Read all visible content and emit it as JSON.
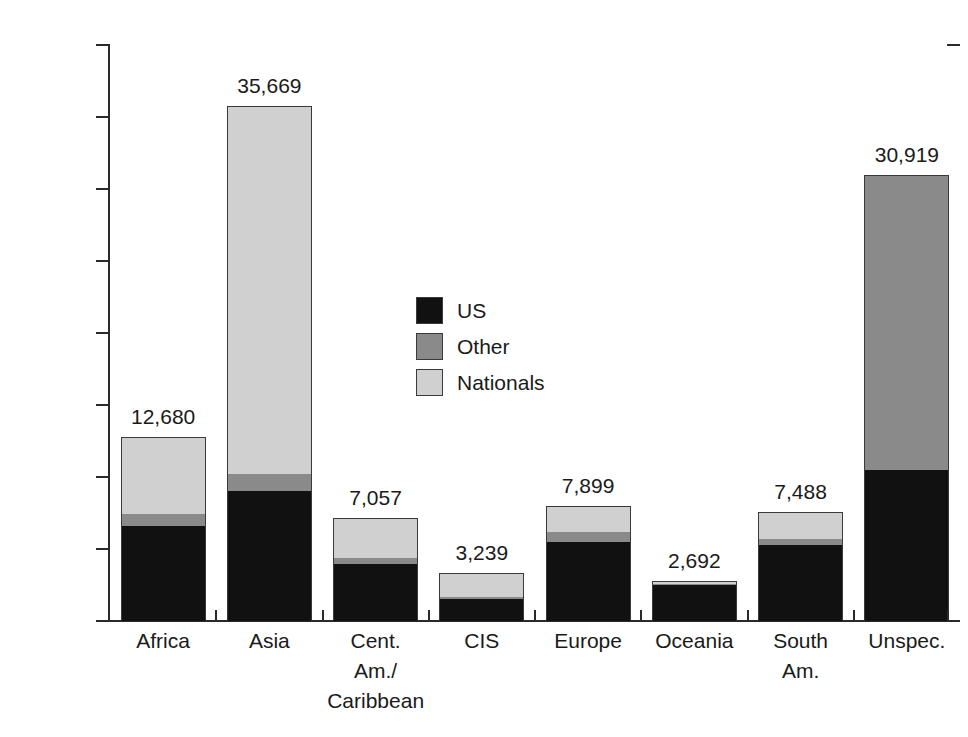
{
  "chart_data": {
    "type": "bar",
    "subtype": "stacked-bar",
    "title": "",
    "xlabel": "",
    "ylabel": "",
    "ylim": [
      0,
      40000
    ],
    "ytick_values": [
      0,
      5000,
      10000,
      15000,
      20000,
      25000,
      30000,
      35000,
      40000
    ],
    "ytick_labels": [
      "0",
      "5000",
      "10000",
      "15000",
      "20000",
      "25000",
      "30000",
      "35000",
      "40000"
    ],
    "grid": false,
    "legend_position": "center-inside",
    "categories": [
      "Africa",
      "Asia",
      "Cent. Am./Caribbean",
      "CIS",
      "Europe",
      "Oceania",
      "South Am.",
      "Unspec."
    ],
    "category_label_lines": [
      [
        "Africa"
      ],
      [
        "Asia"
      ],
      [
        "Cent.",
        "Am./",
        "Caribbean"
      ],
      [
        "CIS"
      ],
      [
        "Europe"
      ],
      [
        "Oceania"
      ],
      [
        "South",
        "Am."
      ],
      [
        "Unspec."
      ]
    ],
    "series": [
      {
        "name": "US",
        "color": "#111111",
        "values": [
          6600,
          9000,
          3950,
          1500,
          5500,
          2500,
          5300,
          10500
        ]
      },
      {
        "name": "Other",
        "color": "#8a8a8a",
        "values": [
          800,
          1200,
          450,
          200,
          700,
          60,
          400,
          20419
        ]
      },
      {
        "name": "Nationals",
        "color": "#d0d0d0",
        "values": [
          5280,
          25469,
          2657,
          1539,
          1699,
          132,
          1788,
          0
        ]
      }
    ],
    "totals": [
      12680,
      35669,
      7057,
      3239,
      7899,
      2692,
      7488,
      30919
    ],
    "total_labels": [
      "12,680",
      "35,669",
      "7,057",
      "3,239",
      "7,899",
      "2,692",
      "7,488",
      "30,919"
    ]
  },
  "legend": {
    "items": [
      {
        "label": "US",
        "color": "#111111"
      },
      {
        "label": "Other",
        "color": "#8a8a8a"
      },
      {
        "label": "Nationals",
        "color": "#d0d0d0"
      }
    ]
  }
}
